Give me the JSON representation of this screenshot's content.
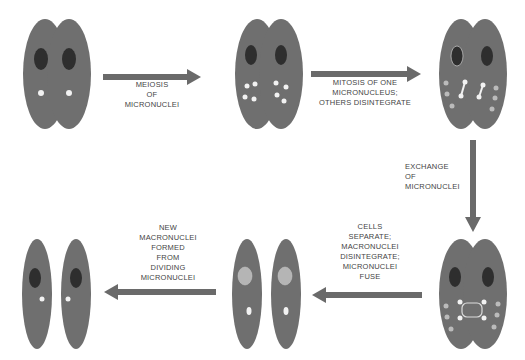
{
  "diagram": {
    "colors": {
      "cell": "#6f6f6f",
      "macronucleus": "#2e2e2e",
      "micronucleus": "#f2f2f2",
      "arrow": "#6a6a6a",
      "text": "#444444"
    },
    "stages": [
      {
        "id": 1,
        "name": "conjugating-pair-initial"
      },
      {
        "id": 2,
        "name": "after-meiosis"
      },
      {
        "id": 3,
        "name": "after-mitosis"
      },
      {
        "id": 4,
        "name": "after-exchange"
      },
      {
        "id": 5,
        "name": "separated-cells"
      },
      {
        "id": 6,
        "name": "final-cells"
      }
    ],
    "steps": [
      {
        "lines": [
          "MEIOSIS",
          "OF",
          "MICRONUCLEI"
        ]
      },
      {
        "lines": [
          "MITOSIS OF ONE",
          "MICRONUCLEUS;",
          "OTHERS DISINTEGRATE"
        ]
      },
      {
        "lines": [
          "EXCHANGE",
          "OF",
          "MICRONUCLEI"
        ]
      },
      {
        "lines": [
          "CELLS",
          "SEPARATE;",
          "MACRONUCLEI",
          "DISINTEGRATE;",
          "MICRONUCLEI",
          "FUSE"
        ]
      },
      {
        "lines": [
          "NEW",
          "MACRONUCLEI",
          "FORMED",
          "FROM",
          "DIVIDING",
          "MICRONUCLEI"
        ]
      }
    ]
  }
}
